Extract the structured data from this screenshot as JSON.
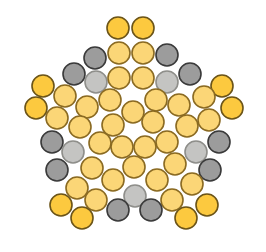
{
  "diagram": {
    "type": "circle-packing",
    "radius": 11,
    "palette": {
      "bright_yellow": {
        "fill": "#fcc93f",
        "stroke": "#6b5418"
      },
      "light_yellow": {
        "fill": "#fbd677",
        "stroke": "#8a6a22"
      },
      "dark_gray": {
        "fill": "#9c9c9c",
        "stroke": "#3a3a3a"
      },
      "light_gray": {
        "fill": "#c4c4c2",
        "stroke": "#8e8e8a"
      }
    },
    "circles": [
      {
        "x": 118,
        "y": 28,
        "c": "bright_yellow"
      },
      {
        "x": 143,
        "y": 28,
        "c": "bright_yellow"
      },
      {
        "x": 95,
        "y": 58,
        "c": "dark_gray"
      },
      {
        "x": 119,
        "y": 53,
        "c": "light_yellow"
      },
      {
        "x": 143,
        "y": 53,
        "c": "light_yellow"
      },
      {
        "x": 167,
        "y": 55,
        "c": "dark_gray"
      },
      {
        "x": 74,
        "y": 74,
        "c": "dark_gray"
      },
      {
        "x": 96,
        "y": 82,
        "c": "light_gray"
      },
      {
        "x": 119,
        "y": 78,
        "c": "light_yellow"
      },
      {
        "x": 143,
        "y": 78,
        "c": "light_yellow"
      },
      {
        "x": 167,
        "y": 82,
        "c": "light_gray"
      },
      {
        "x": 190,
        "y": 74,
        "c": "dark_gray"
      },
      {
        "x": 43,
        "y": 86,
        "c": "bright_yellow"
      },
      {
        "x": 222,
        "y": 86,
        "c": "bright_yellow"
      },
      {
        "x": 36,
        "y": 108,
        "c": "bright_yellow"
      },
      {
        "x": 232,
        "y": 108,
        "c": "bright_yellow"
      },
      {
        "x": 65,
        "y": 96,
        "c": "light_yellow"
      },
      {
        "x": 204,
        "y": 97,
        "c": "light_yellow"
      },
      {
        "x": 87,
        "y": 107,
        "c": "light_yellow"
      },
      {
        "x": 110,
        "y": 100,
        "c": "light_yellow"
      },
      {
        "x": 156,
        "y": 100,
        "c": "light_yellow"
      },
      {
        "x": 179,
        "y": 105,
        "c": "light_yellow"
      },
      {
        "x": 133,
        "y": 112,
        "c": "light_yellow"
      },
      {
        "x": 57,
        "y": 118,
        "c": "light_yellow"
      },
      {
        "x": 209,
        "y": 120,
        "c": "light_yellow"
      },
      {
        "x": 80,
        "y": 127,
        "c": "light_yellow"
      },
      {
        "x": 113,
        "y": 125,
        "c": "light_yellow"
      },
      {
        "x": 153,
        "y": 122,
        "c": "light_yellow"
      },
      {
        "x": 187,
        "y": 126,
        "c": "light_yellow"
      },
      {
        "x": 52,
        "y": 142,
        "c": "dark_gray"
      },
      {
        "x": 73,
        "y": 152,
        "c": "light_gray"
      },
      {
        "x": 100,
        "y": 143,
        "c": "light_yellow"
      },
      {
        "x": 122,
        "y": 147,
        "c": "light_yellow"
      },
      {
        "x": 145,
        "y": 147,
        "c": "light_yellow"
      },
      {
        "x": 167,
        "y": 142,
        "c": "light_yellow"
      },
      {
        "x": 196,
        "y": 152,
        "c": "light_gray"
      },
      {
        "x": 219,
        "y": 142,
        "c": "dark_gray"
      },
      {
        "x": 57,
        "y": 170,
        "c": "dark_gray"
      },
      {
        "x": 92,
        "y": 168,
        "c": "light_yellow"
      },
      {
        "x": 134,
        "y": 167,
        "c": "light_yellow"
      },
      {
        "x": 175,
        "y": 164,
        "c": "light_yellow"
      },
      {
        "x": 210,
        "y": 170,
        "c": "dark_gray"
      },
      {
        "x": 77,
        "y": 188,
        "c": "light_yellow"
      },
      {
        "x": 113,
        "y": 180,
        "c": "light_yellow"
      },
      {
        "x": 157,
        "y": 180,
        "c": "light_yellow"
      },
      {
        "x": 192,
        "y": 184,
        "c": "light_yellow"
      },
      {
        "x": 135,
        "y": 196,
        "c": "light_gray"
      },
      {
        "x": 96,
        "y": 200,
        "c": "light_yellow"
      },
      {
        "x": 172,
        "y": 200,
        "c": "light_yellow"
      },
      {
        "x": 61,
        "y": 205,
        "c": "bright_yellow"
      },
      {
        "x": 207,
        "y": 205,
        "c": "bright_yellow"
      },
      {
        "x": 82,
        "y": 218,
        "c": "bright_yellow"
      },
      {
        "x": 118,
        "y": 210,
        "c": "dark_gray"
      },
      {
        "x": 151,
        "y": 210,
        "c": "dark_gray"
      },
      {
        "x": 186,
        "y": 218,
        "c": "bright_yellow"
      }
    ]
  }
}
